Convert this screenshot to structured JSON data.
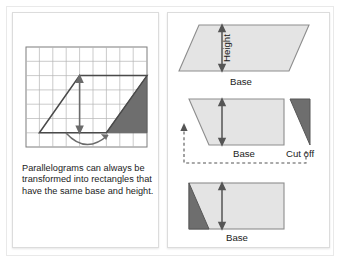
{
  "figure": {
    "title_alt": "Parallelogram to rectangle transformation",
    "colors": {
      "shape_fill": "#e4e4e4",
      "shape_stroke": "#8d8d8d",
      "cut_fill": "#6e6e6e",
      "cut_stroke": "#575757",
      "grid_line": "#9a9a9a",
      "grid_line_light": "#c9c9c9",
      "arrow": "#6b6b6b",
      "text": "#1b1b1b",
      "panel_border": "#dcdcdc",
      "frame_border": "#e9e9e9",
      "background": "#ffffff"
    }
  },
  "left_panel": {
    "grid": {
      "name": "grid-diagram",
      "columns": 9,
      "rows": 7,
      "parallelogram_points": "1,6 4,2 9,2 6,6",
      "height_arrow": {
        "from_y": 6,
        "to_y": 2,
        "at_x": 4
      },
      "curved_arrow": "swing-left",
      "shaded_triangle_points": "6,6 9,2 9,6"
    },
    "caption": "Parallelograms can always be transformed into rectangles that have the same base and height."
  },
  "right_panel": {
    "figures": [
      {
        "id": "parallelogram-with-height",
        "height_label": "Height",
        "base_label": "Base",
        "shape": "parallelogram"
      },
      {
        "id": "parallelogram-cut",
        "base_label": "Base",
        "cut_label": "Cut off",
        "shape": "trapezoid-plus-triangle",
        "move_arrow": "dashed-move-left"
      },
      {
        "id": "rectangle-result",
        "base_label": "Base",
        "shape": "rectangle-with-triangle"
      }
    ]
  }
}
